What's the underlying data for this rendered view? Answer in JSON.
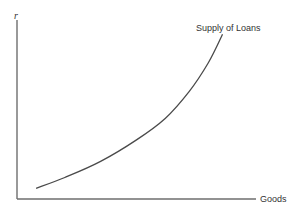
{
  "chart_data": {
    "type": "line",
    "title": "",
    "xlabel": "Goods",
    "ylabel": "r",
    "grid": false,
    "legend": "none",
    "xlim": [
      0,
      1
    ],
    "ylim": [
      0,
      1
    ],
    "series": [
      {
        "name": "Supply of Loans",
        "label": "Supply of Loans",
        "shape": "convex upward-sloping curve",
        "x": [
          0.08,
          0.2,
          0.35,
          0.5,
          0.62,
          0.72,
          0.8,
          0.86
        ],
        "y": [
          0.06,
          0.12,
          0.21,
          0.33,
          0.45,
          0.6,
          0.76,
          0.92
        ]
      }
    ]
  },
  "colors": {
    "axis": "#6e6e6e",
    "curve": "#4a4a4a",
    "text": "#333333"
  }
}
